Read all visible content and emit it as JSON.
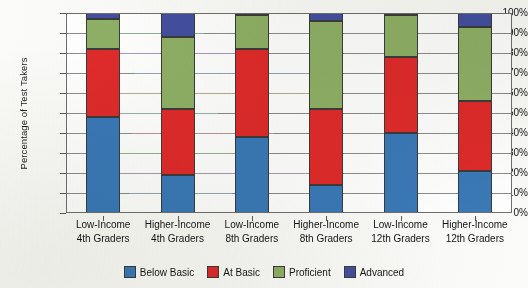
{
  "chart_data": {
    "type": "bar",
    "title": "",
    "xlabel": "",
    "ylabel": "Percentage of Test Takers",
    "ylim": [
      0,
      100
    ],
    "grid": true,
    "stacked": true,
    "stack_total": 100,
    "legend_position": "bottom",
    "categories": [
      "Low-Income 4th Graders",
      "Higher-Income 4th Graders",
      "Low-Income 8th Graders",
      "Higher-Income 8th Graders",
      "Low-Income 12th Graders",
      "Higher-Income 12th Graders"
    ],
    "category_lines": [
      [
        "Low-Income",
        "4th Graders"
      ],
      [
        "Higher-Income",
        "4th Graders"
      ],
      [
        "Low-Income",
        "8th Graders"
      ],
      [
        "Higher-Income",
        "8th Graders"
      ],
      [
        "Low-Income",
        "12th Graders"
      ],
      [
        "Higher-Income",
        "12th Graders"
      ]
    ],
    "ytick_labels": [
      "100%",
      "90%",
      "80%",
      "70%",
      "60%",
      "50%",
      "40%",
      "30%",
      "20%",
      "10%",
      "0%"
    ],
    "ytick_values": [
      100,
      90,
      80,
      70,
      60,
      50,
      40,
      30,
      20,
      10,
      0
    ],
    "series": [
      {
        "name": "Below Basic",
        "color": "#3a79b8",
        "values": [
          48,
          19,
          38,
          14,
          40,
          21
        ]
      },
      {
        "name": "At Basic",
        "color": "#e02b2b",
        "values": [
          34,
          33,
          44,
          38,
          38,
          35
        ]
      },
      {
        "name": "Proficient",
        "color": "#8fb066",
        "values": [
          15,
          36,
          17,
          44,
          21,
          37
        ]
      },
      {
        "name": "Advanced",
        "color": "#4450a0",
        "values": [
          3,
          12,
          1,
          4,
          1,
          7
        ]
      }
    ],
    "cumulative_tops": [
      [
        48,
        82,
        97,
        100
      ],
      [
        19,
        52,
        88,
        100
      ],
      [
        38,
        82,
        99,
        100
      ],
      [
        14,
        52,
        96,
        100
      ],
      [
        40,
        78,
        99,
        100
      ],
      [
        21,
        56,
        93,
        100
      ]
    ]
  },
  "legend": {
    "items": [
      {
        "label": "Below Basic",
        "color": "#3a79b8"
      },
      {
        "label": "At Basic",
        "color": "#e02b2b"
      },
      {
        "label": "Proficient",
        "color": "#8fb066"
      },
      {
        "label": "Advanced",
        "color": "#4450a0"
      }
    ]
  }
}
